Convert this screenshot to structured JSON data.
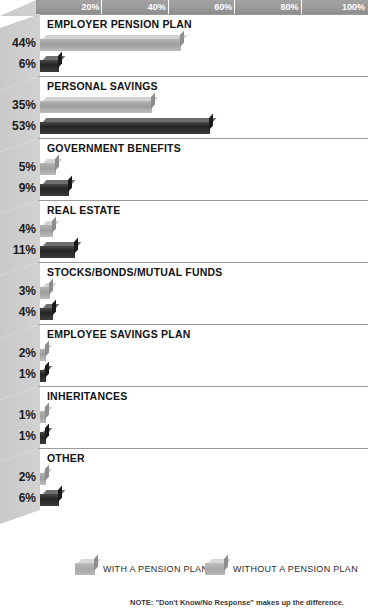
{
  "chart_data": {
    "type": "bar",
    "title": "",
    "orientation": "horizontal",
    "xlabel": "",
    "ylabel": "",
    "xlim": [
      0,
      100
    ],
    "grid": false,
    "axis_ticks": [
      "20%",
      "40%",
      "60%",
      "80%",
      "100%"
    ],
    "axis_tick_values": [
      20,
      40,
      60,
      80,
      100
    ],
    "legend_position": "bottom",
    "categories": [
      "EMPLOYER PENSION PLAN",
      "PERSONAL SAVINGS",
      "GOVERNMENT BENEFITS",
      "REAL ESTATE",
      "STOCKS/BONDS/MUTUAL FUNDS",
      "EMPLOYEE SAVINGS PLAN",
      "INHERITANCES",
      "OTHER"
    ],
    "series": [
      {
        "name": "WITH A PENSION PLAN",
        "color": "#a6a6a6",
        "values": [
          44,
          35,
          5,
          4,
          3,
          2,
          1,
          2
        ],
        "labels": [
          "44%",
          "35%",
          "5%",
          "4%",
          "3%",
          "2%",
          "1%",
          "2%"
        ]
      },
      {
        "name": "WITHOUT A PENSION PLAN",
        "color": "#2a2a2a",
        "values": [
          6,
          53,
          9,
          11,
          4,
          1,
          1,
          6
        ],
        "labels": [
          "6%",
          "53%",
          "9%",
          "11%",
          "4%",
          "1%",
          "1%",
          "6%"
        ]
      }
    ],
    "note": "NOTE: \"Don't Know/No Response\" makes up the difference."
  },
  "legend": {
    "items": [
      {
        "label": "WITH A PENSION PLAN"
      },
      {
        "label": "WITHOUT A PENSION PLAN"
      }
    ]
  }
}
